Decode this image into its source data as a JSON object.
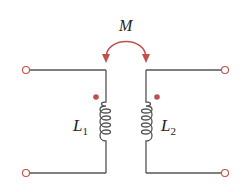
{
  "diagram": {
    "type": "coupled-inductors",
    "mutual_label": "M",
    "inductor_left": {
      "label": "L",
      "subscript": "1"
    },
    "inductor_right": {
      "label": "L",
      "subscript": "2"
    },
    "colors": {
      "wire": "#555555",
      "accent": "#c0504d"
    }
  }
}
